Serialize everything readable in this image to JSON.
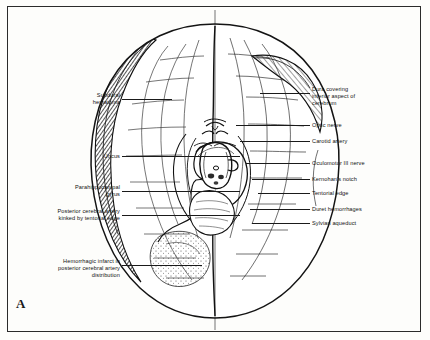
{
  "figure": {
    "panel_letter": "A",
    "caption_labels_left": [
      {
        "text": "Subdural\nhematoma",
        "x": 62,
        "y": 92,
        "w": 58,
        "leader_x": 122,
        "leader_y": 99,
        "leader_w": 50
      },
      {
        "text": "Uncus",
        "x": 84,
        "y": 153,
        "w": 36,
        "leader_x": 122,
        "leader_y": 156,
        "leader_w": 118
      },
      {
        "text": "Parahippocampal\ngyrus",
        "x": 44,
        "y": 184,
        "w": 76,
        "leader_x": 122,
        "leader_y": 191,
        "leader_w": 118
      },
      {
        "text": "Posterior cerebral artery\nkinked by tentorial edge",
        "x": 18,
        "y": 208,
        "w": 102,
        "leader_x": 122,
        "leader_y": 215,
        "leader_w": 118
      },
      {
        "text": "Hemorrhagic infarct in\nposterior cerebral artery\ndistribution",
        "x": 28,
        "y": 258,
        "w": 92,
        "leader_x": 122,
        "leader_y": 265,
        "leader_w": 80
      }
    ],
    "caption_labels_right": [
      {
        "text": "Dura covering\ninferior aspect of\ncerebrum",
        "x": 312,
        "y": 86,
        "w": 100,
        "leader_x": 260,
        "leader_y": 93,
        "leader_w": 50
      },
      {
        "text": "Optic nerve",
        "x": 312,
        "y": 122,
        "w": 100,
        "leader_x": 236,
        "leader_y": 125,
        "leader_w": 74
      },
      {
        "text": "Carotid artery",
        "x": 312,
        "y": 138,
        "w": 100,
        "leader_x": 240,
        "leader_y": 141,
        "leader_w": 70
      },
      {
        "text": "Oculomotor III nerve",
        "x": 312,
        "y": 160,
        "w": 100,
        "leader_x": 246,
        "leader_y": 163,
        "leader_w": 64
      },
      {
        "text": "Kernohan's notch",
        "x": 312,
        "y": 176,
        "w": 100,
        "leader_x": 252,
        "leader_y": 179,
        "leader_w": 58
      },
      {
        "text": "Tentorial edge",
        "x": 312,
        "y": 190,
        "w": 100,
        "leader_x": 258,
        "leader_y": 193,
        "leader_w": 52
      },
      {
        "text": "Duret hemorrhages",
        "x": 312,
        "y": 206,
        "w": 100,
        "leader_x": 250,
        "leader_y": 209,
        "leader_w": 60
      },
      {
        "text": "Sylvian aqueduct",
        "x": 312,
        "y": 220,
        "w": 100,
        "leader_x": 252,
        "leader_y": 223,
        "leader_w": 58
      }
    ],
    "structures": {
      "title": "inferior surface of cerebrum with transtentorial herniation",
      "hemisphere_left_label": "swollen hemisphere with subdural hematoma",
      "hemisphere_right_label": "contralateral hemisphere"
    }
  }
}
